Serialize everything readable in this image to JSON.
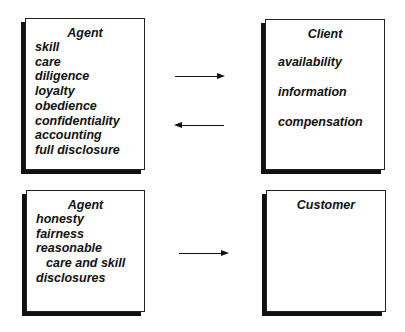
{
  "agent_client": {
    "agent": {
      "title": "Agent",
      "items": [
        "skill",
        "care",
        "diligence",
        "loyalty",
        "obedience",
        "confidentiality",
        "accounting",
        "full disclosure"
      ]
    },
    "client": {
      "title": "Client",
      "items": [
        "availability",
        "information",
        "compensation"
      ]
    },
    "arrows": [
      "agent-to-client",
      "client-to-agent"
    ]
  },
  "agent_customer": {
    "agent": {
      "title": "Agent",
      "items": [
        "honesty",
        "fairness",
        "reasonable",
        "care and skill",
        "disclosures"
      ]
    },
    "customer": {
      "title": "Customer"
    },
    "arrows": [
      "agent-to-customer"
    ]
  }
}
